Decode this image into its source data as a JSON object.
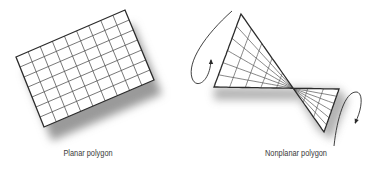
{
  "figure": {
    "planar": {
      "caption": "Planar polygon",
      "caption_x": 88,
      "corners": [
        [
          16,
          57
        ],
        [
          125,
          10
        ],
        [
          154,
          80
        ],
        [
          44,
          127
        ]
      ],
      "columns": 9,
      "rows": 7,
      "shadow_offset": [
        8,
        14
      ]
    },
    "nonplanar": {
      "caption": "Nonplanar polygon",
      "caption_x": 296,
      "corners": {
        "p00": [
          241,
          14
        ],
        "p01": [
          214,
          87
        ],
        "p10": [
          324,
          132
        ],
        "p11": [
          339,
          89
        ]
      },
      "u_divisions": 8,
      "v_divisions": 6,
      "arrows": [
        {
          "name": "rotation-arrow-left",
          "path": "M232,11 C205,35 187,62 192,78 C196,90 210,82 211,60",
          "head": [
            211,
            59
          ],
          "head_dir": -90
        },
        {
          "name": "rotation-arrow-right",
          "path": "M334,146 C337,118 345,92 356,92 C364,92 362,110 355,123",
          "head": [
            355,
            124
          ],
          "head_dir": 110
        }
      ]
    },
    "colors": {
      "line": "#2b2b2b",
      "grid": "#555555",
      "shadow": "#9a9a9a",
      "caption": "#3a3a3a"
    }
  }
}
